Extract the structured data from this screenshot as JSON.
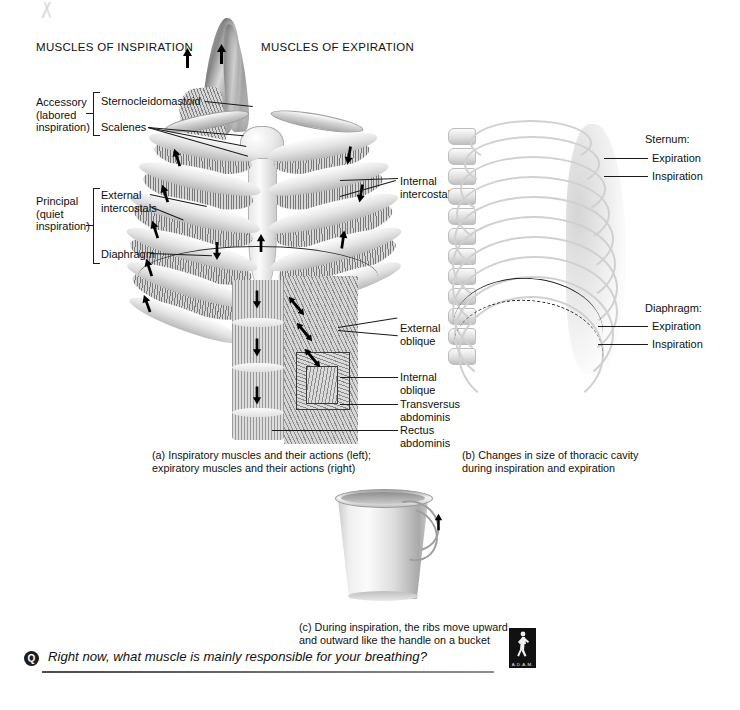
{
  "page": {
    "figure_title": "Muscles of respiration",
    "background": "#ffffff"
  },
  "headers": {
    "inspiration": "MUSCLES OF INSPIRATION",
    "expiration": "MUSCLES OF EXPIRATION"
  },
  "groups": {
    "accessory": "Accessory\n(labored\ninspiration)",
    "principal": "Principal\n(quiet\ninspiration)"
  },
  "labels_left": [
    {
      "id": "sternocleidomastoid",
      "text": "Sternocleidomastoid"
    },
    {
      "id": "scalenes",
      "text": "Scalenes"
    },
    {
      "id": "external-intercostals",
      "text": "External\nintercostals"
    },
    {
      "id": "diaphragm",
      "text": "Diaphragm"
    }
  ],
  "labels_right": [
    {
      "id": "internal-intercostals",
      "text": "Internal\nintercostals"
    },
    {
      "id": "external-oblique",
      "text": "External\noblique"
    },
    {
      "id": "internal-oblique",
      "text": "Internal\noblique"
    },
    {
      "id": "transversus-abdominis",
      "text": "Transversus\nabdominis"
    },
    {
      "id": "rectus-abdominis",
      "text": "Rectus\nabdominis"
    }
  ],
  "panel_b_labels": {
    "sternum_title": "Sternum:",
    "sternum_expiration": "Expiration",
    "sternum_inspiration": "Inspiration",
    "diaphragm_title": "Diaphragm:",
    "diaphragm_expiration": "Expiration",
    "diaphragm_inspiration": "Inspiration"
  },
  "captions": {
    "a": "(a) Inspiratory muscles and their actions (left);\n     expiratory muscles and their actions (right)",
    "b": "(b) Changes in size of thoracic cavity\n      during inspiration and expiration",
    "c": "(c) During inspiration, the ribs move upward\n     and outward like the handle on a bucket"
  },
  "question": {
    "badge": "Q",
    "text": "Right now, what muscle is mainly responsible for your breathing?"
  },
  "logo": {
    "name": "A.D.A.M.",
    "caption": "A.D.A.M."
  },
  "colors": {
    "ink": "#101010",
    "bone": "#e3e3e3",
    "muscle": "#8f8f8f",
    "rule": "#4a4a4a"
  }
}
